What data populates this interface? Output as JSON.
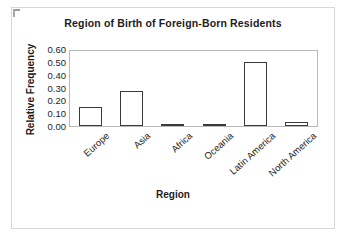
{
  "chart_data": {
    "type": "bar",
    "title": "Region of Birth of Foreign-Born Residents",
    "xlabel": "Region",
    "ylabel": "Relative Frequency",
    "categories": [
      "Europe",
      "Asia",
      "Africa",
      "Oceania",
      "Latin America",
      "North America"
    ],
    "values": [
      0.15,
      0.28,
      0.02,
      0.01,
      0.51,
      0.03
    ],
    "ylim": [
      0.0,
      0.6
    ],
    "ytick_values": [
      0.6,
      0.5,
      0.4,
      0.3,
      0.2,
      0.1,
      0.0
    ],
    "ytick_labels": [
      "0.60",
      "0.50",
      "0.40",
      "0.30",
      "0.20",
      "0.10",
      "0.00"
    ],
    "grid": false,
    "legend": false,
    "bar_fill_color": "#ffffff",
    "bar_edge_color": "#3a3a3a",
    "plot_frame_color": "#b9b9b9",
    "text_color": "#1c1c1c",
    "xtick_label_rotation": -42
  }
}
